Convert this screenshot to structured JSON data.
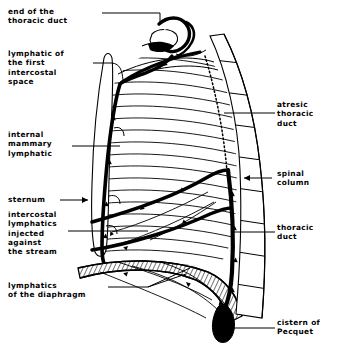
{
  "figure": {
    "background_color": "#ffffff",
    "ink_color": "#000000",
    "width": 339,
    "height": 344
  },
  "labels": {
    "end_of_thoracic_duct": "end of the\nthoracic duct",
    "lymphatic_first_intercostal_space": "lymphatic of\nthe first\nintercostal\nspace",
    "internal_mammary_lymphatic": "internal\nmammary\nlymphatic",
    "sternum": "sternum",
    "intercostal_lymphatics_injected": "intercostal\nlymphatics\ninjected\nagainst\nthe stream",
    "lymphatics_of_the_diaphragm": "lymphatics\nof the diaphragm",
    "atresic_thoracic_duct": "atresic\nthoracic\nduct",
    "spinal_column": "spinal\ncolumn",
    "thoracic_duct": "thoracic\nduct",
    "cistern_of_pecquet": "cistern of\nPecquet"
  },
  "structures": [
    {
      "name": "thoracic-duct-terminus",
      "description": "Terminal arch of the thoracic duct at the venous angle"
    },
    {
      "name": "rib-cage",
      "description": "Curved ribs and intercostal spaces of the left hemithorax"
    },
    {
      "name": "sternum",
      "description": "Elongated outline of the sternum on the anterior border"
    },
    {
      "name": "internal-mammary-lymphatic",
      "description": "Thick lymphatic chain running along the sternal border"
    },
    {
      "name": "intercostal-lymphatic-bands",
      "description": "Two heavy transverse lymphatic trunks crossing the ribs"
    },
    {
      "name": "diaphragm",
      "description": "Hatched lymphatic band of the diaphragm"
    },
    {
      "name": "spinal-column",
      "description": "Segmented vertebral column along the posterior border"
    },
    {
      "name": "thoracic-duct-trunk",
      "description": "Thick vertical duct ascending beside the spine"
    },
    {
      "name": "cistern-of-pecquet",
      "description": "Solid black teardrop reservoir at the base of the duct"
    }
  ]
}
